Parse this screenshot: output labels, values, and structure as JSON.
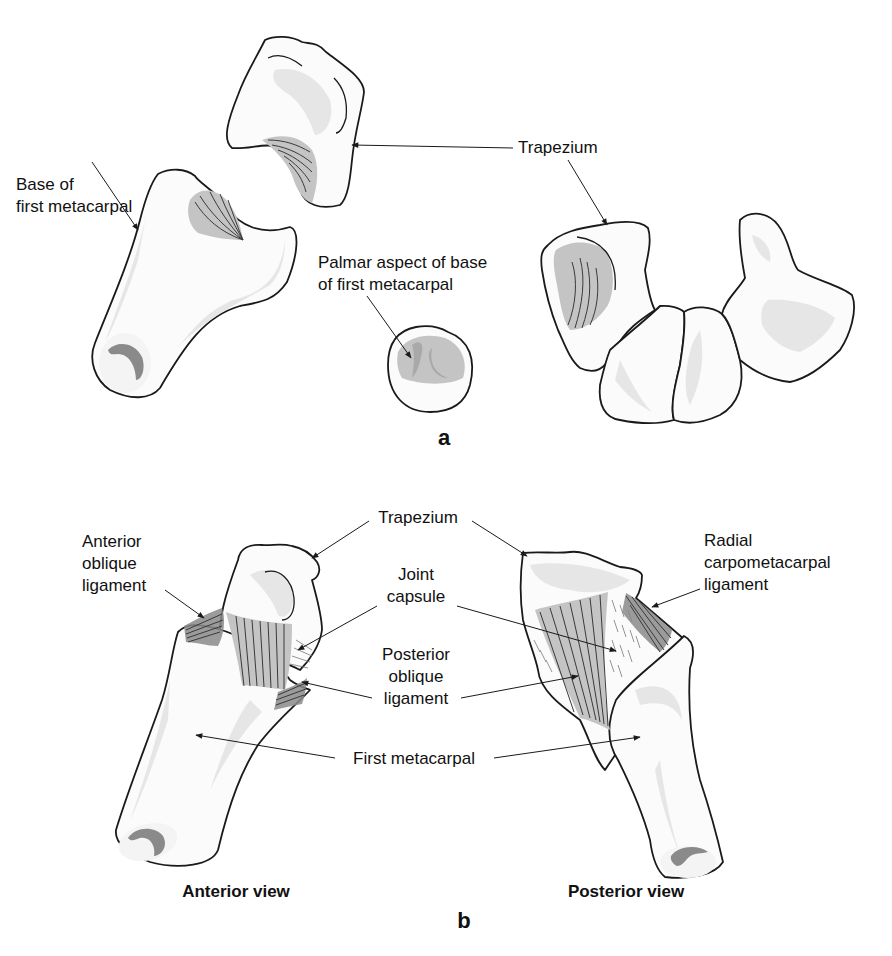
{
  "panels": {
    "a": {
      "label": "a",
      "labels": {
        "base_first_metacarpal": [
          "Base of",
          "first metacarpal"
        ],
        "trapezium": "Trapezium",
        "palmar_aspect": [
          "Palmar aspect of base",
          "of first metacarpal"
        ]
      }
    },
    "b": {
      "label": "b",
      "labels": {
        "anterior_oblique_ligament": [
          "Anterior",
          "oblique",
          "ligament"
        ],
        "trapezium": "Trapezium",
        "joint_capsule": [
          "Joint",
          "capsule"
        ],
        "posterior_oblique_ligament": [
          "Posterior",
          "oblique",
          "ligament"
        ],
        "first_metacarpal": "First metacarpal",
        "radial_carpometacarpal_ligament": [
          "Radial",
          "carpometacarpal",
          "ligament"
        ]
      },
      "views": {
        "anterior": "Anterior view",
        "posterior": "Posterior view"
      }
    }
  },
  "colors": {
    "outline": "#1a1a1a",
    "bone_fill": "#fbfbfb",
    "bone_shade": "#e6e6e6",
    "articular_facet": "#c4c4c4",
    "medullary_cavity": "#8a8a8a",
    "background": "#ffffff"
  }
}
